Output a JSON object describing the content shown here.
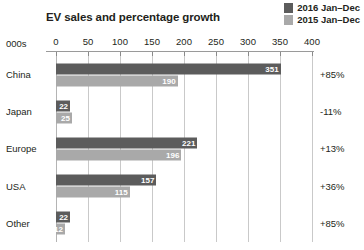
{
  "chart_data": {
    "type": "bar",
    "orientation": "horizontal",
    "title": "EV sales and percentage growth",
    "units_label": "000s",
    "xlabel": "",
    "ylabel": "",
    "xlim": [
      0,
      400
    ],
    "xticks": [
      0,
      50,
      100,
      150,
      200,
      250,
      300,
      350,
      400
    ],
    "grid": true,
    "legend_position": "top-right",
    "categories": [
      "China",
      "Japan",
      "Europe",
      "USA",
      "Other"
    ],
    "series": [
      {
        "name": "2016 Jan–Dec",
        "color": "#5c5c5c",
        "values": [
          351,
          22,
          221,
          157,
          22
        ]
      },
      {
        "name": "2015 Jan–Dec",
        "color": "#a9a9a9",
        "values": [
          190,
          25,
          196,
          115,
          12
        ]
      }
    ],
    "annotations": {
      "growth_column_label": "",
      "growth": [
        "+85%",
        "-11%",
        "+13%",
        "+36%",
        "+85%"
      ]
    }
  }
}
